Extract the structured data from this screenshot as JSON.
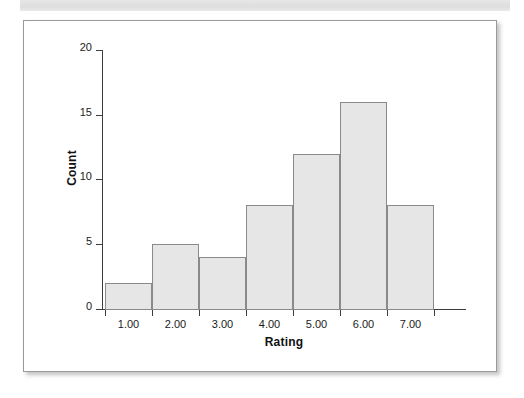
{
  "panel": {
    "banner_label": "",
    "background_color": "#ffffff",
    "border_color": "#9a9a9a"
  },
  "chart_data": {
    "type": "bar",
    "title": "",
    "subtitle": "",
    "xlabel": "Rating",
    "ylabel": "Count",
    "categories": [
      "1.00",
      "2.00",
      "3.00",
      "4.00",
      "5.00",
      "6.00",
      "7.00"
    ],
    "values": [
      2,
      5,
      4,
      8,
      12,
      16,
      8
    ],
    "bin_edges": [
      0.5,
      1.5,
      2.5,
      3.5,
      4.5,
      5.5,
      6.5,
      7.5
    ],
    "x_tick_labels": [
      "1.00",
      "2.00",
      "3.00",
      "4.00",
      "5.00",
      "6.00",
      "7.00"
    ],
    "y_tick_labels": [
      "0",
      "5",
      "10",
      "15",
      "20"
    ],
    "y_ticks": [
      0,
      5,
      10,
      15,
      20
    ],
    "ylim": [
      0,
      20
    ],
    "xlim": [
      0.5,
      7.75
    ],
    "grid": false,
    "legend": false,
    "bar_fill_color": "#e6e6e6",
    "bar_edge_color": "#8a8a8a",
    "axis_color": "#3d3d3d"
  }
}
